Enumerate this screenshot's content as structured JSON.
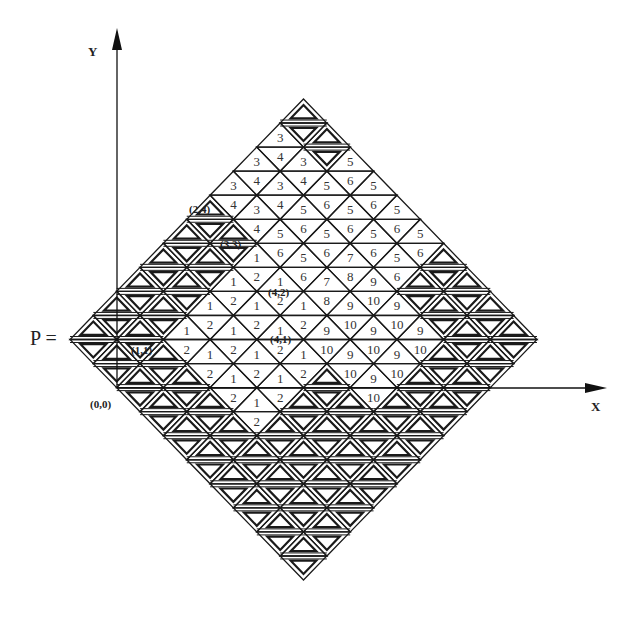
{
  "figure": {
    "p_label": "P =",
    "x_axis_label": "X",
    "y_axis_label": "Y",
    "origin_label": "(0,0)",
    "coord_labels": [
      {
        "text": "(2,4)",
        "x": 189,
        "y": 203
      },
      {
        "text": "(3,3)",
        "x": 220,
        "y": 238
      },
      {
        "text": "(4,2)",
        "x": 268,
        "y": 286
      },
      {
        "text": "(4,1)",
        "x": 270,
        "y": 333
      },
      {
        "text": "(1,1)",
        "x": 131,
        "y": 344
      }
    ],
    "colors": {
      "line": "#1a1a1a",
      "text": "#333333",
      "background": "#ffffff"
    }
  },
  "grid": {
    "left_apex_x": 70,
    "top_apex_y": 99,
    "half_base": 23.35,
    "row_height": 24.05,
    "rows": [
      [
        "U"
      ],
      [
        "3",
        "D",
        "U"
      ],
      [
        "3",
        "4",
        "3",
        "D",
        "5"
      ],
      [
        "3",
        "4",
        "3",
        "4",
        "5",
        "6",
        "5"
      ],
      [
        "U",
        "4",
        "3",
        "4",
        "5",
        "6",
        "5",
        "6",
        "5"
      ],
      [
        "U",
        "D",
        "U",
        "4",
        "5",
        "6",
        "5",
        "6",
        "5",
        "6",
        "5"
      ],
      [
        "U",
        "D",
        "U",
        "D",
        "1",
        "6",
        "5",
        "6",
        "7",
        "6",
        "5",
        "6",
        "U"
      ],
      [
        "U",
        "D",
        "U",
        "D",
        "1",
        "2",
        "1",
        "6",
        "7",
        "8",
        "9",
        "6",
        "U",
        "D",
        "U"
      ],
      [
        "U",
        "D",
        "U",
        "D",
        "1",
        "2",
        "1",
        "2",
        "1",
        "8",
        "9",
        "10",
        "9",
        "D",
        "U",
        "D",
        "U"
      ],
      [
        "U",
        "D",
        "U",
        "D",
        "1",
        "2",
        "1",
        "2",
        "1",
        "2",
        "9",
        "10",
        "9",
        "10",
        "9",
        "D",
        "U",
        "D",
        "U"
      ],
      [
        "D",
        "U",
        "D",
        "U",
        "2",
        "1",
        "2",
        "1",
        "2",
        "1",
        "10",
        "9",
        "10",
        "9",
        "10",
        "U",
        "D",
        "U",
        "D"
      ],
      [
        "D",
        "U",
        "D",
        "U",
        "2",
        "1",
        "2",
        "1",
        "2",
        "U",
        "10",
        "9",
        "10",
        "U",
        "D",
        "U",
        "D"
      ],
      [
        "D",
        "U",
        "D",
        "U",
        "2",
        "1",
        "2",
        "U",
        "D",
        "U",
        "10",
        "U",
        "D",
        "U",
        "D"
      ],
      [
        "D",
        "U",
        "D",
        "U",
        "2",
        "U",
        "D",
        "U",
        "D",
        "U",
        "D",
        "U",
        "D"
      ],
      [
        "D",
        "U",
        "D",
        "U",
        "D",
        "U",
        "D",
        "U",
        "D",
        "U",
        "D"
      ],
      [
        "D",
        "U",
        "D",
        "U",
        "D",
        "U",
        "D",
        "U",
        "D"
      ],
      [
        "D",
        "U",
        "D",
        "U",
        "D",
        "U",
        "D"
      ],
      [
        "D",
        "U",
        "D",
        "U",
        "D"
      ],
      [
        "D",
        "U",
        "D"
      ],
      [
        "D"
      ]
    ]
  },
  "axes": {
    "origin_x": 117,
    "x_axis_y": 388,
    "x_axis_end": 607,
    "y_axis_top": 28,
    "y_axis_bottom": 388
  }
}
